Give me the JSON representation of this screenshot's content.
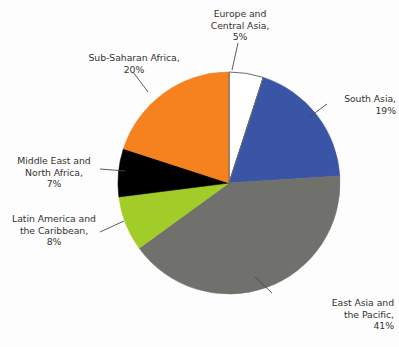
{
  "chart_data": {
    "type": "pie",
    "title": "",
    "xlabel": "",
    "ylabel": "",
    "unit": "%",
    "start_angle_deg": 0,
    "direction": "clockwise",
    "legend": "none",
    "labels_position": "outside-with-leader-lines",
    "categories": [
      "Europe and Central Asia",
      "South Asia",
      "East Asia and the Pacific",
      "Latin America and the Caribbean",
      "Middle East and North Africa",
      "Sub-Saharan Africa"
    ],
    "values": [
      5,
      19,
      41,
      8,
      7,
      20
    ],
    "colors": [
      "#ffffff",
      "#3a55a5",
      "#70706c",
      "#a2cc28",
      "#000000",
      "#f5821f"
    ],
    "slices": [
      {
        "label": "Europe and Central Asia",
        "value": 5,
        "value_text": "5%",
        "color": "#ffffff"
      },
      {
        "label": "South Asia",
        "value": 19,
        "value_text": "19%",
        "color": "#3a55a5"
      },
      {
        "label": "East Asia and the Pacific",
        "value": 41,
        "value_text": "41%",
        "color": "#70706c"
      },
      {
        "label": "Latin America and the Caribbean",
        "value": 8,
        "value_text": "8%",
        "color": "#a2cc28"
      },
      {
        "label": "Middle East and North Africa",
        "value": 7,
        "value_text": "7%",
        "color": "#000000"
      },
      {
        "label": "Sub-Saharan Africa",
        "value": 20,
        "value_text": "20%",
        "color": "#f5821f"
      }
    ]
  },
  "labels": {
    "europe": "Europe and\nCentral Asia,\n5%",
    "south_asia": "South Asia,\n19%",
    "east_asia": "East Asia and\nthe Pacific,\n41%",
    "latin_america": "Latin America and\nthe Caribbean,\n8%",
    "mena": "Middle East and\nNorth Africa,\n7%",
    "subsaharan": "Sub-Saharan Africa,\n20%"
  },
  "style": {
    "background": "#fdfdfd",
    "text_color": "#35332f",
    "leader_line_color": "#4a4a48",
    "slice_outline_color": "#6b6b68"
  }
}
